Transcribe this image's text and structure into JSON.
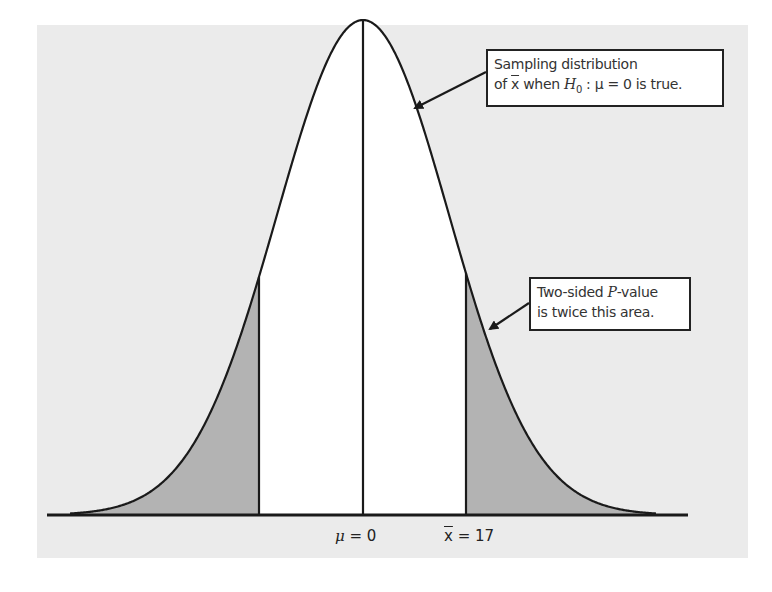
{
  "figure": {
    "type": "two-sided p-value normal curve",
    "panel_color": "#ebebeb",
    "curve_fill_center": "#ffffff",
    "tail_fill": "#b3b3b3",
    "line_color": "#1a1a1a"
  },
  "callouts": {
    "sampling": {
      "line1": "Sampling distribution",
      "line2_prefix": "of ",
      "line2_xbar": "x",
      "line2_mid": " when ",
      "line2_H": "H",
      "line2_sub": "0",
      "line2_suffix": " : μ = 0 is true."
    },
    "pvalue": {
      "line1_prefix": "Two-sided ",
      "line1_P": "P",
      "line1_suffix": "-value",
      "line2": "is twice this area."
    }
  },
  "axis": {
    "mu_symbol": "μ",
    "mu_eq": " = 0",
    "xbar_symbol": "x",
    "xbar_eq": " = 17"
  },
  "chart_data": {
    "type": "area",
    "title": "",
    "xlabel": "",
    "ylabel": "",
    "distribution": "normal",
    "mean": 0,
    "observed_statistic": 17,
    "tick_labels": [
      "μ = 0",
      "x̄ = 17"
    ],
    "shaded_regions": [
      "x ≤ -17",
      "x ≥ 17"
    ],
    "annotations": [
      "Sampling distribution of x̄ when H0 : μ = 0 is true.",
      "Two-sided P-value is twice this area."
    ],
    "grid": false,
    "legend": "none"
  }
}
